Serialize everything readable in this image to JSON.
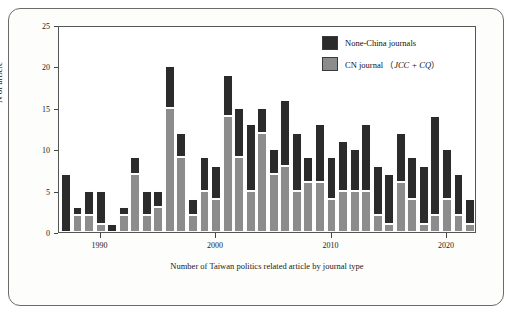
{
  "chart_data": {
    "type": "bar",
    "subtype": "stacked-bar",
    "title": "",
    "xlabel": "Number of Taiwan politics related article by journal type",
    "ylabel": "N of article",
    "ylim": [
      0,
      25
    ],
    "yticks": [
      0,
      5,
      10,
      15,
      20,
      25
    ],
    "xlim": [
      1986.4,
      2022.6
    ],
    "xticks": [
      1990,
      2000,
      2010,
      2020
    ],
    "grid": false,
    "legend_position": "top-right",
    "colors": {
      "none_china": "#2b2b2b",
      "cn_journal": "#8c8c8c",
      "frame": "#555555",
      "text": "#1a1a1a",
      "background": "#ffffff"
    },
    "categories": [
      1987,
      1988,
      1989,
      1990,
      1991,
      1992,
      1993,
      1994,
      1995,
      1996,
      1997,
      1998,
      1999,
      2000,
      2001,
      2002,
      2003,
      2004,
      2005,
      2006,
      2007,
      2008,
      2009,
      2010,
      2011,
      2012,
      2013,
      2014,
      2015,
      2016,
      2017,
      2018,
      2019,
      2020,
      2021,
      2022
    ],
    "series": [
      {
        "name": "CN journal (JCC + CQ)",
        "key": "cn_journal",
        "color": "#8c8c8c",
        "values": [
          0,
          2,
          2,
          1,
          0,
          2,
          7,
          2,
          3,
          15,
          9,
          2,
          5,
          4,
          14,
          9,
          5,
          12,
          7,
          8,
          5,
          6,
          6,
          4,
          5,
          5,
          5,
          2,
          1,
          6,
          4,
          1,
          2,
          4,
          2,
          1
        ]
      },
      {
        "name": "None-China journals",
        "key": "none_china",
        "color": "#2b2b2b",
        "values": [
          7,
          1,
          3,
          4,
          1,
          1,
          2,
          3,
          2,
          5,
          3,
          2,
          4,
          4,
          5,
          6,
          8,
          3,
          3,
          8,
          7,
          3,
          7,
          5,
          6,
          5,
          8,
          6,
          6,
          6,
          5,
          7,
          12,
          6,
          5,
          3
        ]
      }
    ],
    "totals": [
      7,
      3,
      5,
      5,
      1,
      3,
      9,
      5,
      5,
      20,
      12,
      4,
      9,
      8,
      19,
      15,
      13,
      15,
      10,
      16,
      12,
      9,
      13,
      9,
      11,
      10,
      13,
      8,
      7,
      12,
      9,
      8,
      14,
      10,
      7,
      4
    ]
  },
  "legend": {
    "items": [
      {
        "label": "None-China journals",
        "italic_part": "",
        "color": "#2b2b2b"
      },
      {
        "label_prefix": "CN journal  （",
        "label_italic": "JCC + CQ",
        "label_suffix": "）",
        "color": "#8c8c8c"
      }
    ],
    "item0_label": "None-China journals",
    "item1_prefix": "CN journal  （",
    "item1_italic": "JCC + CQ",
    "item1_suffix": "）"
  },
  "axes": {
    "ylabel": "N of article",
    "xlabel": "Number of Taiwan politics related article by journal type",
    "ytick_labels": [
      "0",
      "5",
      "10",
      "15",
      "20",
      "25"
    ],
    "xtick_labels": [
      "1990",
      "2000",
      "2010",
      "2020"
    ]
  }
}
